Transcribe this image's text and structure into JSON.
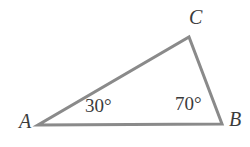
{
  "figure": {
    "type": "geometry-diagram",
    "shape": "triangle",
    "background_color": "#ffffff",
    "stroke_color": "#8a8a8a",
    "stroke_width": 3,
    "text_color": "#3b3b3b",
    "vertices": [
      {
        "name": "A",
        "label": "A",
        "x": 38,
        "y": 125
      },
      {
        "name": "B",
        "label": "B",
        "x": 222,
        "y": 124
      },
      {
        "name": "C",
        "label": "C",
        "x": 189,
        "y": 37
      }
    ],
    "edges": [
      {
        "name": "side-AB",
        "from": "A",
        "to": "B"
      },
      {
        "name": "side-BC",
        "from": "B",
        "to": "C"
      },
      {
        "name": "side-CA",
        "from": "C",
        "to": "A"
      }
    ],
    "angles": [
      {
        "at": "A",
        "label": "30°",
        "value": 30
      },
      {
        "at": "B",
        "label": "70°",
        "value": 70
      },
      {
        "at": "C",
        "label": "",
        "value": 80
      }
    ]
  }
}
